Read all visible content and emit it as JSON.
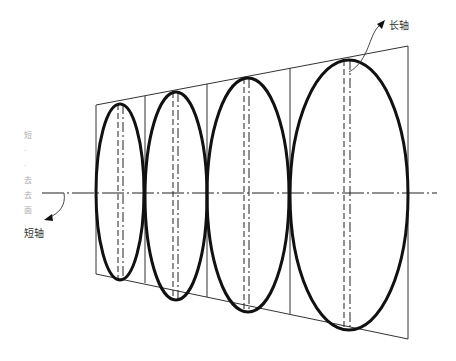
{
  "labels": {
    "long_axis": "长轴",
    "short_axis": "短轴"
  },
  "side_text": [
    "短",
    "·",
    "·",
    "去",
    "去",
    "面",
    "·"
  ],
  "colors": {
    "stroke": "#111111",
    "thin": "#333333",
    "background": "#ffffff"
  },
  "figure": {
    "axis": {
      "x1": 42,
      "x2": 437,
      "y": 193
    },
    "trapezoid": {
      "tl": [
        96,
        105
      ],
      "tr": [
        408,
        46
      ],
      "br": [
        408,
        339
      ],
      "bl": [
        96,
        274
      ]
    },
    "ellipses": [
      {
        "cx": 120,
        "cy": 192,
        "rx": 24,
        "ry": 88
      },
      {
        "cx": 176,
        "cy": 196,
        "rx": 31,
        "ry": 104
      },
      {
        "cx": 248,
        "cy": 195,
        "rx": 41,
        "ry": 117
      },
      {
        "cx": 349,
        "cy": 195,
        "rx": 59,
        "ry": 135
      }
    ]
  }
}
